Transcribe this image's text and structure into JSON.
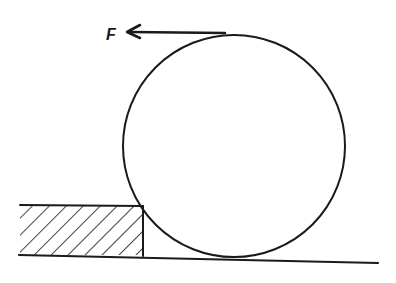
{
  "diagram": {
    "type": "physics-free-body",
    "force": {
      "label": "F",
      "direction": "left",
      "application_point": "top of wheel"
    },
    "wheel": {
      "shape": "circle"
    },
    "step": {
      "shape": "rectangle",
      "fill": "hatched"
    },
    "ground": {
      "shape": "line"
    },
    "colors": {
      "ink": "#1a1a1a",
      "background": "#ffffff"
    }
  }
}
